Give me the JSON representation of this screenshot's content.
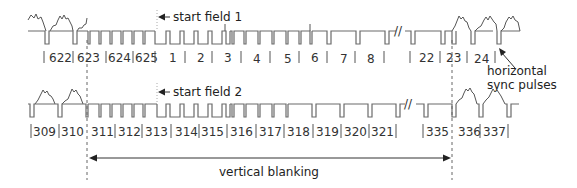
{
  "diagram": {
    "field1": {
      "start_label": "start field 1",
      "line_numbers": [
        "622",
        "623",
        "624",
        "625",
        "1",
        "2",
        "3",
        "4",
        "5",
        "6",
        "7",
        "8",
        "22",
        "23",
        "24"
      ]
    },
    "field2": {
      "start_label": "start field 2",
      "line_numbers": [
        "309",
        "310",
        "311",
        "312",
        "313",
        "314",
        "315",
        "316",
        "317",
        "318",
        "319",
        "320",
        "321",
        "335",
        "336",
        "337"
      ]
    },
    "annotations": {
      "hsync_line1": "horizontal",
      "hsync_line2": "sync pulses",
      "vertical_blanking": "vertical blanking",
      "break_mark": "//"
    },
    "colors": {
      "signal": "#6a6a6a",
      "text": "#333333",
      "dashed_marker": "#666666"
    }
  }
}
